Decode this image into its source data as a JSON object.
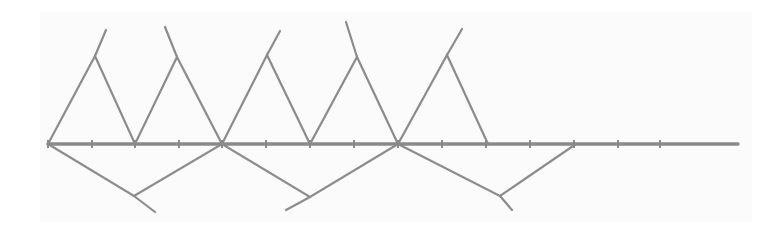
{
  "diagram": {
    "type": "line-diagram",
    "colors": {
      "background": "#ffffff",
      "paper": "#fbfbfb",
      "line": "#8c8c8c",
      "axis": "#8a8a8a"
    },
    "axis": {
      "y": 144,
      "x_start": 48,
      "x_end": 738,
      "ticks_x": [
        48,
        92,
        135,
        179,
        222,
        266,
        310,
        354,
        398,
        442,
        486,
        530,
        574,
        618,
        660
      ]
    },
    "upper_zigzag": {
      "points": [
        [
          48,
          144
        ],
        [
          95,
          56
        ],
        [
          135,
          144
        ],
        [
          177,
          57
        ],
        [
          222,
          144
        ],
        [
          267,
          55
        ],
        [
          310,
          144
        ],
        [
          357,
          57
        ],
        [
          398,
          144
        ],
        [
          447,
          55
        ],
        [
          488,
          144
        ]
      ],
      "extensions": [
        [
          [
            95,
            56
          ],
          [
            106,
            30
          ]
        ],
        [
          [
            177,
            57
          ],
          [
            165,
            27
          ]
        ],
        [
          [
            267,
            55
          ],
          [
            280,
            31
          ]
        ],
        [
          [
            357,
            57
          ],
          [
            346,
            22
          ]
        ],
        [
          [
            447,
            55
          ],
          [
            462,
            29
          ]
        ]
      ]
    },
    "lower_zigzag": {
      "points": [
        [
          48,
          144
        ],
        [
          134,
          196
        ],
        [
          222,
          144
        ],
        [
          310,
          197
        ],
        [
          398,
          144
        ],
        [
          500,
          196
        ],
        [
          576,
          144
        ]
      ],
      "extensions": [
        [
          [
            134,
            196
          ],
          [
            155,
            212
          ]
        ],
        [
          [
            310,
            197
          ],
          [
            286,
            210
          ]
        ],
        [
          [
            500,
            196
          ],
          [
            512,
            210
          ]
        ]
      ]
    }
  }
}
